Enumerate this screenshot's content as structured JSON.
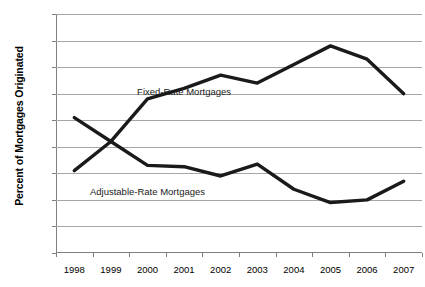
{
  "chart_data": {
    "type": "line",
    "title": "",
    "xlabel": "",
    "ylabel": "Percent of Mortgages Originated",
    "categories": [
      "1998",
      "1999",
      "2000",
      "2001",
      "2002",
      "2003",
      "2004",
      "2005",
      "2006",
      "2007"
    ],
    "ylim": [
      0,
      90
    ],
    "ytick_labels": [
      "0",
      "10",
      "20",
      "30",
      "40",
      "50",
      "60",
      "70",
      "80",
      "90"
    ],
    "ytick_values": [
      0,
      10,
      20,
      30,
      40,
      50,
      60,
      70,
      80,
      90
    ],
    "grid": "horizontal",
    "legend": "inline-annotations",
    "series": [
      {
        "name": "Fixed-Rate Mortgages",
        "values": [
          51,
          42,
          58,
          62,
          67,
          64,
          71,
          78,
          73,
          60
        ],
        "color": "#1a1a1a"
      },
      {
        "name": "Adjustable-Rate Mortgages",
        "values": [
          31,
          42,
          33,
          32.5,
          29,
          33.5,
          24,
          19,
          20,
          27
        ],
        "color": "#1a1a1a"
      }
    ],
    "annotations": [
      {
        "text": "Fixed-Rate Mortgages",
        "at_category": "2001",
        "at_value": 60.5
      },
      {
        "text": "Adjustable-Rate Mortgages",
        "at_category": "2000",
        "at_value": 23.0
      }
    ]
  },
  "colors": {
    "line": "#1a1a1a",
    "gridline": "#a6a6a6",
    "axis": "#7f7f7f",
    "background": "#ffffff",
    "text": "#000000"
  }
}
